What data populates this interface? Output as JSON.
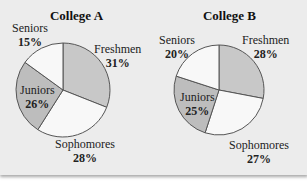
{
  "chart_data": [
    {
      "type": "pie",
      "title": "College A",
      "categories": [
        "Freshmen",
        "Sophomores",
        "Juniors",
        "Seniors"
      ],
      "values": [
        31,
        28,
        26,
        15
      ],
      "labels": [
        "31%",
        "28%",
        "26%",
        "15%"
      ],
      "colors": [
        "#c8c8c8",
        "#f8f8f8",
        "#bdbdbd",
        "#f8f8f8"
      ]
    },
    {
      "type": "pie",
      "title": "College B",
      "categories": [
        "Freshmen",
        "Sophomores",
        "Juniors",
        "Seniors"
      ],
      "values": [
        28,
        27,
        25,
        20
      ],
      "labels": [
        "28%",
        "27%",
        "25%",
        "20%"
      ],
      "colors": [
        "#c8c8c8",
        "#f8f8f8",
        "#bdbdbd",
        "#f8f8f8"
      ]
    }
  ]
}
